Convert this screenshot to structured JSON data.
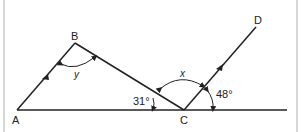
{
  "diagram": {
    "points": {
      "A": {
        "label": "A",
        "x": 17,
        "y": 110
      },
      "B": {
        "label": "B",
        "x": 75,
        "y": 43
      },
      "C": {
        "label": "C",
        "x": 184,
        "y": 110
      },
      "D": {
        "label": "D",
        "x": 256,
        "y": 27
      }
    },
    "angles": {
      "y": {
        "label": "y"
      },
      "x": {
        "label": "x"
      },
      "acb": {
        "label": "31°"
      },
      "dc_line": {
        "label": "48°"
      }
    },
    "colors": {
      "line": "#222222",
      "border": "#bdbdbd",
      "background": "#ffffff"
    }
  }
}
